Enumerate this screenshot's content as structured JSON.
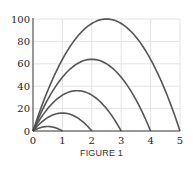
{
  "chart_data": {
    "type": "line",
    "title": "",
    "caption": "FIGURE 1",
    "xlabel": "",
    "ylabel": "",
    "xlim": [
      0,
      5
    ],
    "ylim": [
      0,
      100
    ],
    "x_ticks": [
      "0",
      "1",
      "2",
      "3",
      "4",
      "5"
    ],
    "y_ticks": [
      "0",
      "20",
      "40",
      "60",
      "80",
      "100"
    ],
    "grid": true,
    "legend": null,
    "series": [
      {
        "name": "curve-1",
        "formula": "y = 16x(1 - x)",
        "roots": [
          0,
          1
        ],
        "peak": [
          0.5,
          4
        ]
      },
      {
        "name": "curve-2",
        "formula": "y = 16x(2 - x)",
        "roots": [
          0,
          2
        ],
        "peak": [
          1,
          16
        ]
      },
      {
        "name": "curve-3",
        "formula": "y = 16x(3 - x)",
        "roots": [
          0,
          3
        ],
        "peak": [
          1.5,
          36
        ]
      },
      {
        "name": "curve-4",
        "formula": "y = 16x(4 - x)",
        "roots": [
          0,
          4
        ],
        "peak": [
          2,
          64
        ]
      },
      {
        "name": "curve-5",
        "formula": "y = 16x(5 - x)",
        "roots": [
          0,
          5
        ],
        "peak": [
          2.5,
          100
        ]
      }
    ],
    "line_color": "#555555",
    "grid_color": "#e4e4e4",
    "axis_color": "#333333"
  }
}
